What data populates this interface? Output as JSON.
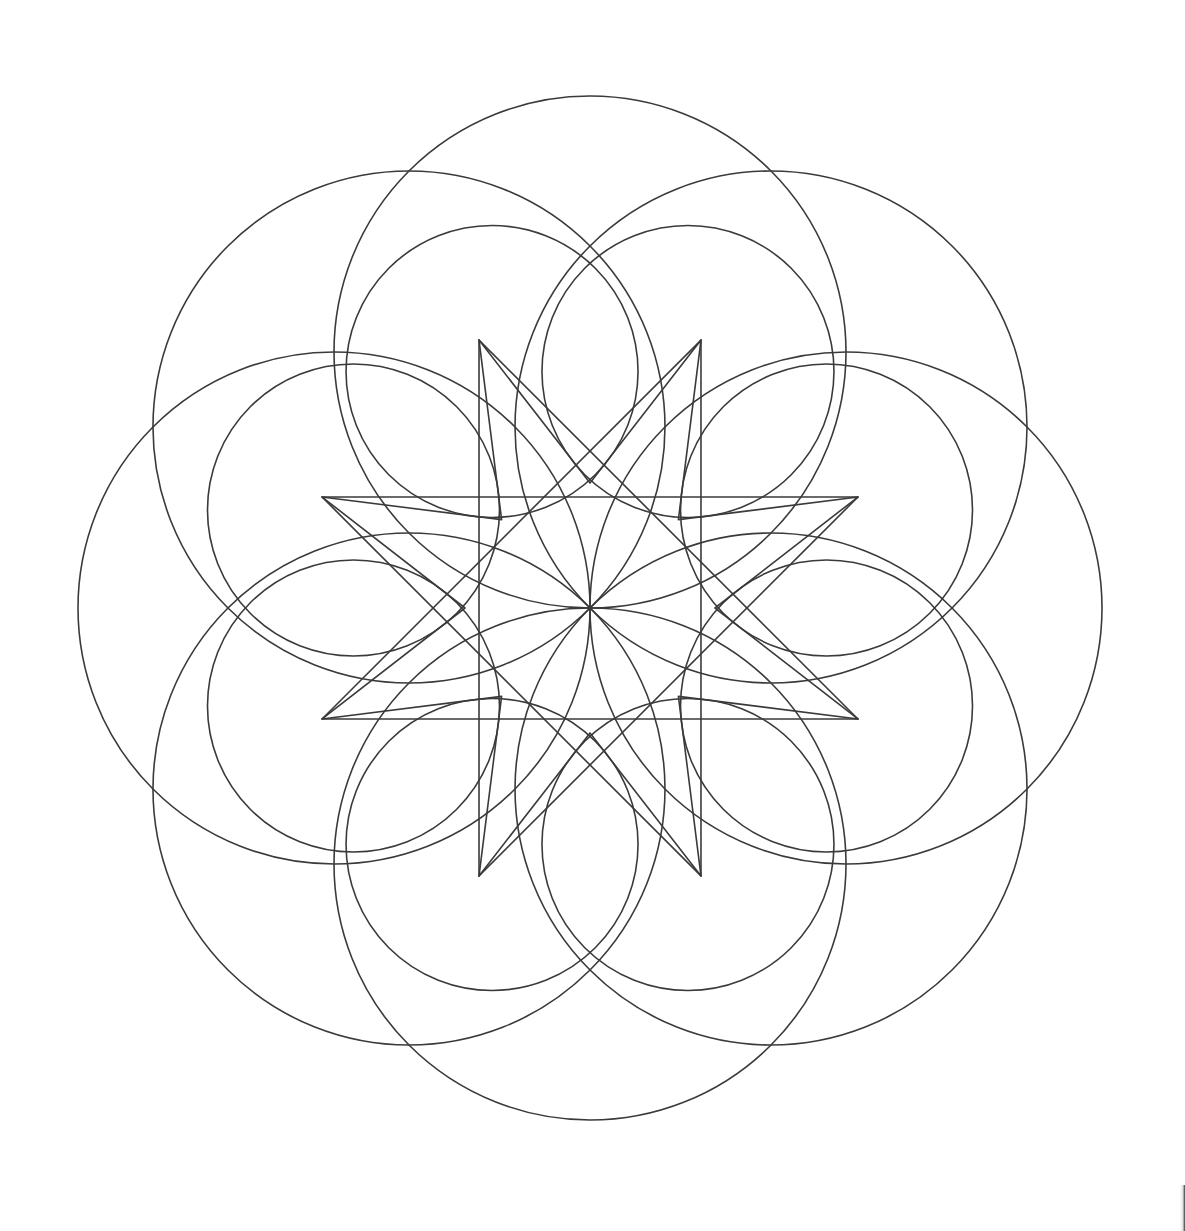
{
  "artwork": {
    "title": "Eight-fold Geometric Rosette Line Drawing",
    "kind": "geometric-construction-diagram",
    "background_color": "#ffffff",
    "stroke_color": "#3a3a3a",
    "stroke_width": 1.6,
    "canvas": {
      "width": 1185,
      "height": 1231
    }
  },
  "geometry": {
    "center": {
      "x": 590,
      "y": 608
    },
    "symmetry_order": 8,
    "rotation_offset_deg": -90,
    "outer_petal_ring": {
      "count": 8,
      "circle_radius": 256,
      "center_distance": 256,
      "description": "eight large overlapping circles whose outer arcs form the scalloped petal border"
    },
    "inner_petal_ring": {
      "count": 8,
      "circle_radius": 146,
      "center_distance": 256,
      "description": "eight smaller circles concentric with the large ones, forming the inner lens shapes"
    },
    "star_polygon": {
      "points": 8,
      "outer_radius": 290,
      "inner_radius": 125,
      "description": "central eight-pointed star formed by straight chords"
    },
    "chord_lines": {
      "vertex_radius": 290,
      "description": "straight segments joining alternate star vertices and the radial/tangent construction lines"
    },
    "extent": {
      "top_cusp": {
        "x": 590,
        "y": 85
      },
      "bottom_cusp": {
        "x": 590,
        "y": 1131
      },
      "left_cusp": {
        "x": 85,
        "y": 605
      },
      "right_cusp": {
        "x": 1095,
        "y": 605
      },
      "petal_tip_top": {
        "x": 500,
        "y": 34
      }
    }
  },
  "annotations": {
    "corner_artifact_label": "page-edge-scan-artifact"
  }
}
